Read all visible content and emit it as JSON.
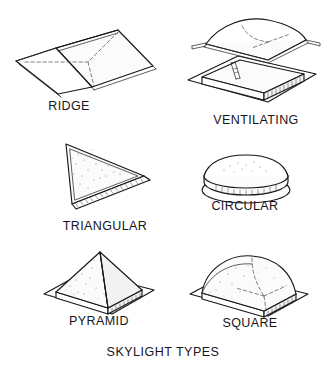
{
  "diagram": {
    "title": "SKYLIGHT TYPES",
    "style": "black-and-white technical line drawing, isometric views, stippled shading",
    "background_color": "#ffffff",
    "line_color": "#17171c",
    "text_color": "#15151a",
    "items": [
      {
        "id": "ridge",
        "label": "RIDGE",
        "row": 1,
        "column": 1,
        "description": "Gabled two-slope ridge skylight with central ridge line and dashed interior glazing lines on a thin frame"
      },
      {
        "id": "ventilating",
        "label": "VENTILATING",
        "row": 1,
        "column": 2,
        "description": "Domed lid hinged open above a ribbed square curb base, with a support arm holding the dome ajar"
      },
      {
        "id": "triangular",
        "label": "TRIANGULAR",
        "row": 2,
        "column": 1,
        "description": "Triangular faceted skylight with stippled glazing face and ribbed curb along the lower edge"
      },
      {
        "id": "circular",
        "label": "CIRCULAR",
        "row": 2,
        "column": 2,
        "description": "Low circular dome seated on a round ribbed flange base"
      },
      {
        "id": "pyramid",
        "label": "PYRAMID",
        "row": 3,
        "column": 1,
        "description": "Four-sided pyramid skylight with visible hip ridges on a ribbed square curb and flat flange"
      },
      {
        "id": "square",
        "label": "SQUARE",
        "row": 3,
        "column": 2,
        "description": "Square dome skylight with rounded vault on a ribbed square curb and flat flange"
      }
    ]
  }
}
